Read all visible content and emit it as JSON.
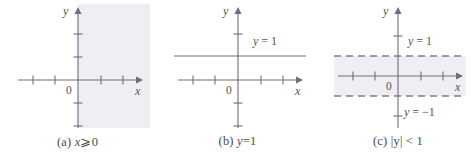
{
  "figure": {
    "background_color": "#ffffff",
    "axis_color": "#6e6e78",
    "text_color": "#555555",
    "shade_color": "#eeeef3",
    "dash_color": "#8a8a96"
  },
  "panels": [
    {
      "id": "panel-a",
      "caption": {
        "tag": "(a)",
        "expression": "x ⩾ 0",
        "variable": "x",
        "operator": "⩾",
        "value": "0"
      },
      "axes": {
        "x_label": "x",
        "y_label": "y",
        "origin_label": "0",
        "x_ticks": [
          -3,
          -2,
          1,
          2
        ],
        "y_ticks": [
          -2,
          -1,
          1,
          2
        ],
        "x_range": [
          -4,
          4
        ],
        "y_range": [
          -3,
          3
        ]
      },
      "region": {
        "type": "half-plane",
        "description": "shaded region x ≥ 0",
        "shaded": true
      },
      "lines": []
    },
    {
      "id": "panel-b",
      "caption": {
        "tag": "(b)",
        "expression": "y = 1",
        "variable": "y",
        "operator": "=",
        "value": "1"
      },
      "axes": {
        "x_label": "x",
        "y_label": "y",
        "origin_label": "0",
        "x_ticks": [
          -3,
          -2,
          1,
          2
        ],
        "y_ticks": [
          -2,
          -1,
          1,
          2
        ],
        "x_range": [
          -4,
          4
        ],
        "y_range": [
          -3,
          3
        ]
      },
      "region": {
        "type": "none",
        "description": "no shading",
        "shaded": false
      },
      "lines": [
        {
          "name": "line-y-equals-1",
          "y": 1,
          "style": "solid",
          "label": "y = 1",
          "label_var": "y",
          "label_rest": " = 1"
        }
      ]
    },
    {
      "id": "panel-c",
      "caption": {
        "tag": "(c)",
        "expression": "|y| < 1",
        "variable": "y",
        "operator": "<",
        "value": "1"
      },
      "axes": {
        "x_label": "x",
        "y_label": "y",
        "origin_label": "0",
        "x_ticks": [
          -3,
          -2,
          1,
          2
        ],
        "y_ticks": [
          -2,
          2
        ],
        "x_range": [
          -4,
          4
        ],
        "y_range": [
          -3,
          3
        ]
      },
      "region": {
        "type": "horizontal-band",
        "description": "shaded band between y = -1 and y = 1",
        "shaded": true
      },
      "lines": [
        {
          "name": "line-y-equals-1",
          "y": 1,
          "style": "dashed",
          "label": "y = 1",
          "label_var": "y",
          "label_rest": " = 1"
        },
        {
          "name": "line-y-equals-neg1",
          "y": -1,
          "style": "dashed",
          "label": "y = −1",
          "label_var": "y",
          "label_rest": " = −1"
        }
      ]
    }
  ]
}
